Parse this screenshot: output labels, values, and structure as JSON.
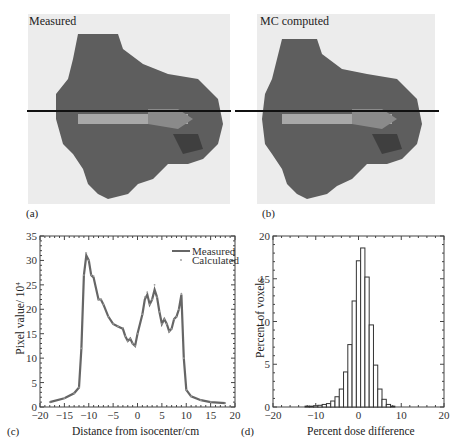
{
  "panels": {
    "a": {
      "label": "(a)",
      "title": "Measured"
    },
    "b": {
      "label": "(b)",
      "title": "MC computed"
    },
    "c": {
      "label": "(c)"
    },
    "d": {
      "label": "(d)"
    }
  },
  "chart_data": [
    {
      "panel": "c",
      "type": "line",
      "title": "",
      "xlabel": "Distance from isocenter/cm",
      "ylabel": "Pixel value/ 10^4",
      "xlim": [
        -20,
        20
      ],
      "ylim": [
        0,
        35
      ],
      "xticks": [
        -20,
        -15,
        -10,
        -5,
        0,
        5,
        10,
        15,
        20
      ],
      "yticks": [
        0,
        5,
        10,
        15,
        20,
        25,
        30,
        35
      ],
      "legend": {
        "position": "upper right",
        "entries": [
          "Measured",
          "Calculated"
        ]
      },
      "x": [
        -18,
        -15,
        -13,
        -12,
        -11.5,
        -11,
        -10.5,
        -10,
        -9.5,
        -9,
        -8,
        -7.5,
        -7,
        -6,
        -5,
        -4,
        -3,
        -2.5,
        -2,
        -1.5,
        -1,
        -0.5,
        0,
        1,
        1.5,
        2,
        2.5,
        3,
        3.5,
        4,
        4.5,
        5,
        5.5,
        6,
        6.5,
        7,
        7.5,
        8,
        8.5,
        9,
        9.5,
        10,
        11,
        13,
        15,
        18
      ],
      "series": [
        {
          "name": "Measured",
          "values": [
            1,
            1.8,
            2.8,
            4,
            12,
            27,
            31,
            30,
            27,
            26.5,
            22,
            22,
            21,
            18.5,
            17,
            16.5,
            16,
            14.5,
            13.5,
            14,
            13,
            12.5,
            15,
            19,
            22,
            23,
            21,
            22,
            24,
            22.5,
            19.5,
            17,
            18,
            17,
            15.5,
            16,
            18,
            18.5,
            20,
            23,
            10,
            3.5,
            2.2,
            1.4,
            1,
            0.8
          ]
        },
        {
          "name": "Calculated",
          "values": [
            1,
            1.8,
            2.8,
            4,
            12,
            27,
            31.5,
            30,
            27,
            26.8,
            22,
            22,
            21,
            18.5,
            17,
            16.5,
            16.2,
            14.5,
            13.5,
            14,
            13,
            12.5,
            15,
            19,
            22.5,
            23.5,
            21,
            22,
            25,
            22.5,
            19.5,
            17,
            18,
            17,
            15.5,
            16,
            18,
            18.5,
            20,
            23.2,
            10,
            3.5,
            2.2,
            1.4,
            1,
            0.8
          ]
        }
      ]
    },
    {
      "panel": "d",
      "type": "bar",
      "title": "",
      "xlabel": "Percent dose difference",
      "ylabel": "Percent of  voxels",
      "xlim": [
        -20,
        20
      ],
      "ylim": [
        0,
        20
      ],
      "xticks": [
        -20,
        -10,
        0,
        10,
        20
      ],
      "yticks": [
        0,
        5,
        10,
        15,
        20
      ],
      "bin_width": 1,
      "categories": [
        -12,
        -11,
        -10,
        -9,
        -8,
        -7,
        -6,
        -5,
        -4,
        -3,
        -2,
        -1,
        0,
        1,
        2,
        3,
        4,
        5,
        6,
        7,
        8
      ],
      "values": [
        0.1,
        0.1,
        0.15,
        0.2,
        0.3,
        0.4,
        0.7,
        1.2,
        2.1,
        4.1,
        7.3,
        12.4,
        17.1,
        18.6,
        15.2,
        9.6,
        4.9,
        2.1,
        0.9,
        0.3,
        0.1
      ]
    }
  ]
}
